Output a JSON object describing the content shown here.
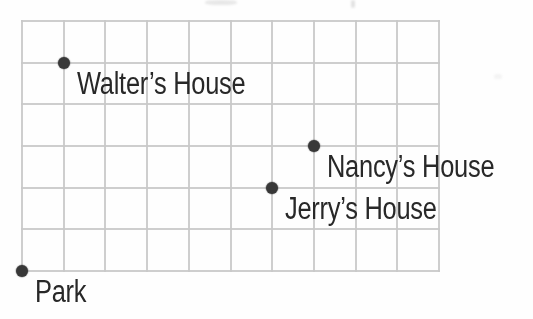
{
  "figure": {
    "background_color": "#fefefe",
    "grid_line_color": "#c9c9c9",
    "point_color": "#383838",
    "label_color": "#282828"
  },
  "chart_data": {
    "type": "scatter",
    "title": "",
    "grid": {
      "visible": true,
      "columns": 10,
      "rows": 6,
      "line_color": "#c9c9c9"
    },
    "axes": {
      "x_range": [
        0,
        10
      ],
      "y_range": [
        0,
        6
      ],
      "tick_labels": "none"
    },
    "point_color": "#383838",
    "label_color": "#282828",
    "points": [
      {
        "label": "Walter’s House",
        "x": 1,
        "y": 5
      },
      {
        "label": "Nancy’s House",
        "x": 7,
        "y": 3
      },
      {
        "label": "Jerry’s House",
        "x": 6,
        "y": 2
      },
      {
        "label": "Park",
        "x": 0,
        "y": 0
      }
    ]
  }
}
